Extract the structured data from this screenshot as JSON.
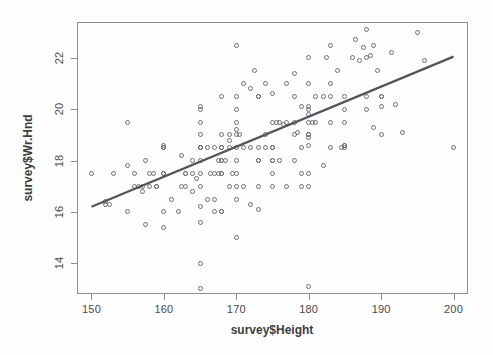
{
  "chart_data": {
    "type": "scatter",
    "title": "",
    "xlabel": "survey$Height",
    "ylabel": "survey$Wr.Hnd",
    "xlim": [
      148.0,
      202.0
    ],
    "ylim": [
      12.8,
      23.4
    ],
    "xticks": [
      150,
      160,
      170,
      180,
      190,
      200
    ],
    "yticks": [
      14,
      16,
      18,
      20,
      22
    ],
    "grid": false,
    "legend": null,
    "point_marker": "open-circle",
    "point_color": "#6f6f75",
    "line_color": "#53535c",
    "box_color": "#8e8e92",
    "trendline": {
      "type": "linear-regression",
      "x0": 150.0,
      "y0": 16.2,
      "x1": 200.0,
      "y1": 22.05,
      "slope": 0.117,
      "intercept": -1.35
    },
    "x": [
      150.0,
      152.0,
      152.0,
      152.5,
      153.0,
      155.0,
      155.0,
      155.0,
      156.0,
      156.0,
      156.5,
      157.0,
      157.0,
      157.5,
      157.5,
      158.0,
      158.0,
      158.5,
      159.0,
      159.0,
      160.0,
      160.0,
      160.0,
      160.0,
      160.0,
      160.0,
      160.0,
      161.0,
      162.0,
      162.5,
      162.5,
      163.0,
      163.0,
      163.0,
      164.0,
      164.0,
      164.0,
      164.5,
      165.0,
      165.0,
      165.0,
      165.0,
      165.0,
      165.0,
      165.0,
      165.0,
      165.0,
      165.0,
      165.0,
      165.0,
      165.0,
      165.0,
      166.0,
      166.0,
      166.5,
      167.0,
      167.0,
      167.0,
      167.0,
      167.5,
      167.5,
      168.0,
      168.0,
      168.0,
      168.0,
      168.0,
      168.0,
      168.0,
      168.0,
      168.0,
      168.0,
      168.5,
      169.0,
      169.0,
      169.0,
      169.0,
      169.5,
      170.0,
      170.0,
      170.0,
      170.0,
      170.0,
      170.0,
      170.0,
      170.0,
      170.0,
      170.0,
      170.0,
      170.0,
      170.5,
      171.0,
      171.0,
      171.0,
      172.0,
      172.0,
      172.0,
      172.5,
      173.0,
      173.0,
      173.0,
      173.0,
      173.0,
      173.0,
      173.0,
      174.0,
      174.0,
      174.0,
      175.0,
      175.0,
      175.0,
      175.0,
      175.0,
      175.0,
      175.0,
      175.0,
      175.5,
      176.0,
      176.0,
      176.5,
      177.0,
      177.0,
      177.0,
      178.0,
      178.0,
      178.0,
      178.0,
      178.0,
      178.5,
      179.0,
      179.0,
      179.0,
      179.0,
      180.0,
      180.0,
      180.0,
      180.0,
      180.0,
      180.0,
      180.0,
      180.0,
      180.0,
      180.0,
      180.0,
      180.0,
      180.0,
      180.5,
      181.0,
      181.0,
      182.0,
      182.0,
      182.5,
      183.0,
      183.0,
      183.0,
      183.0,
      183.0,
      184.0,
      184.5,
      185.0,
      185.0,
      185.0,
      185.0,
      185.0,
      185.0,
      186.0,
      186.5,
      187.0,
      187.5,
      188.0,
      188.0,
      188.0,
      188.0,
      188.5,
      189.0,
      189.0,
      189.5,
      190.0,
      190.0,
      190.0,
      190.0,
      191.5,
      192.0,
      193.0,
      195.0,
      196.0,
      200.0
    ],
    "y": [
      17.5,
      16.3,
      16.4,
      16.3,
      17.5,
      16.0,
      17.8,
      19.5,
      17.0,
      17.5,
      17.0,
      16.8,
      17.0,
      18.0,
      15.5,
      17.0,
      17.5,
      17.5,
      17.0,
      17.0,
      15.4,
      16.0,
      17.5,
      17.5,
      18.5,
      18.5,
      18.6,
      16.5,
      16.0,
      17.0,
      18.2,
      17.0,
      17.5,
      17.5,
      16.8,
      17.5,
      18.0,
      17.3,
      13.0,
      14.0,
      15.6,
      16.2,
      17.0,
      17.5,
      18.0,
      18.5,
      18.5,
      18.5,
      19.0,
      19.5,
      20.0,
      20.1,
      16.5,
      18.5,
      17.5,
      16.0,
      16.5,
      17.5,
      18.5,
      17.5,
      18.0,
      16.0,
      16.0,
      17.5,
      17.5,
      18.0,
      18.0,
      18.5,
      18.5,
      19.0,
      20.5,
      18.0,
      17.0,
      18.5,
      18.8,
      19.0,
      17.5,
      15.0,
      16.5,
      17.0,
      17.5,
      18.0,
      18.5,
      19.0,
      19.2,
      19.5,
      20.0,
      20.5,
      22.5,
      19.0,
      17.0,
      18.5,
      21.0,
      16.3,
      18.5,
      20.8,
      21.5,
      16.1,
      17.0,
      18.0,
      18.0,
      18.5,
      20.5,
      20.5,
      18.5,
      19.0,
      21.0,
      17.5,
      17.0,
      18.0,
      18.0,
      18.5,
      18.5,
      19.5,
      20.6,
      19.5,
      18.0,
      19.5,
      19.4,
      17.0,
      19.5,
      21.0,
      18.0,
      19.0,
      19.5,
      20.5,
      21.4,
      19.1,
      17.0,
      17.5,
      18.5,
      20.1,
      13.1,
      17.0,
      17.5,
      18.6,
      18.9,
      19.0,
      19.0,
      19.5,
      19.8,
      20.0,
      20.1,
      21.0,
      22.0,
      19.5,
      19.5,
      20.5,
      17.8,
      20.5,
      22.0,
      22.5,
      18.5,
      19.5,
      20.5,
      21.0,
      21.5,
      18.5,
      18.6,
      18.5,
      18.6,
      19.5,
      20.0,
      20.5,
      22.0,
      22.7,
      21.9,
      22.4,
      23.1,
      20.0,
      20.5,
      22.0,
      22.1,
      22.5,
      19.3,
      21.5,
      20.5,
      19.0,
      20.1,
      20.5,
      22.2,
      20.2,
      19.1,
      23.0,
      21.9,
      18.5,
      22.0
    ]
  },
  "axes": {
    "x_tick_labels": [
      "150",
      "160",
      "170",
      "180",
      "190",
      "200"
    ],
    "y_tick_labels": [
      "14",
      "16",
      "18",
      "20",
      "22"
    ]
  },
  "labels": {
    "x_axis_title": "survey$Height",
    "y_axis_title": "survey$Wr.Hnd"
  }
}
